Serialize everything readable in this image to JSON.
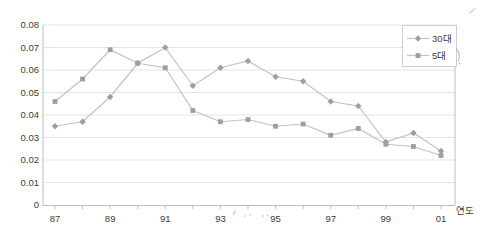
{
  "chart_data": {
    "type": "line",
    "title": "",
    "xlabel": "연도",
    "ylabel": "",
    "ylim": [
      0,
      0.08
    ],
    "ytick_step": 0.01,
    "y_tick_labels": [
      "0",
      "0.01",
      "0.02",
      "0.03",
      "0.04",
      "0.05",
      "0.06",
      "0.07",
      "0.08"
    ],
    "categories": [
      "87",
      "88",
      "89",
      "90",
      "91",
      "92",
      "93",
      "94",
      "95",
      "96",
      "97",
      "98",
      "99",
      "00",
      "01"
    ],
    "x_tick_labels": [
      "87",
      "89",
      "91",
      "93",
      "95",
      "97",
      "99",
      "01"
    ],
    "series": [
      {
        "name": "30대",
        "marker": "diamond",
        "values": [
          0.035,
          0.037,
          0.048,
          0.063,
          0.07,
          0.053,
          0.061,
          0.064,
          0.057,
          0.055,
          0.046,
          0.044,
          0.028,
          0.032,
          0.024
        ]
      },
      {
        "name": "5대",
        "marker": "square",
        "values": [
          0.046,
          0.056,
          0.069,
          0.063,
          0.061,
          0.042,
          0.037,
          0.038,
          0.035,
          0.036,
          0.031,
          0.034,
          0.027,
          0.026,
          0.022
        ]
      }
    ],
    "legend": {
      "position": "top-right",
      "entries": [
        "30대",
        "5대"
      ]
    },
    "grid": true,
    "colors": {
      "line": "#c2c2c2",
      "marker": "#9e9e9e",
      "gridline": "#e4e4e4",
      "axis": "#bdbdbd",
      "text": "#3c3c3c",
      "legend_border": "#cfcfcf",
      "background": "#ffffff"
    }
  }
}
